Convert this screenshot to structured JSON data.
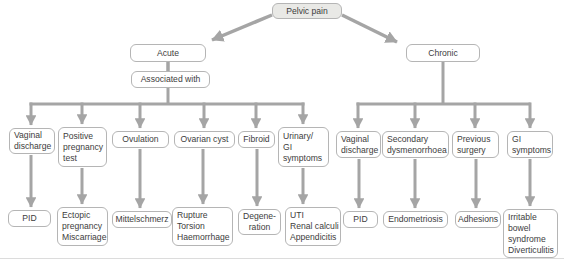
{
  "colors": {
    "line": "#a5a5a5",
    "border": "#b5b5b5",
    "root_fill": "#e9e9e6",
    "text": "#3d3d3d",
    "bg": "#ffffff",
    "page_edge": "#dcdcdc"
  },
  "diagram": {
    "type": "flowchart",
    "root": "Pelvic pain",
    "acute": {
      "label": "Acute",
      "qualifier": "Associated with",
      "branches": [
        {
          "label": "Vaginal\ndischarge",
          "outcome": "PID"
        },
        {
          "label": "Positive\npregnancy\ntest",
          "outcome": "Ectopic\npregnancy\nMiscarriage"
        },
        {
          "label": "Ovulation",
          "outcome": "Mittelschmerz"
        },
        {
          "label": "Ovarian cyst",
          "outcome": "Rupture\nTorsion\nHaemorrhage"
        },
        {
          "label": "Fibroid",
          "outcome": "Degene-\nration"
        },
        {
          "label": "Urinary/\nGI\nsymptoms",
          "outcome": "UTI\nRenal calculi\nAppendicitis"
        }
      ]
    },
    "chronic": {
      "label": "Chronic",
      "branches": [
        {
          "label": "Vaginal\ndischarge",
          "outcome": "PID"
        },
        {
          "label": "Secondary\ndysmenorrhoea",
          "outcome": "Endometriosis"
        },
        {
          "label": "Previous\nsurgery",
          "outcome": "Adhesions"
        },
        {
          "label": "GI\nsymptoms",
          "outcome": "Irritable\nbowel\nsyndrome\nDiverticulitis"
        }
      ]
    }
  }
}
